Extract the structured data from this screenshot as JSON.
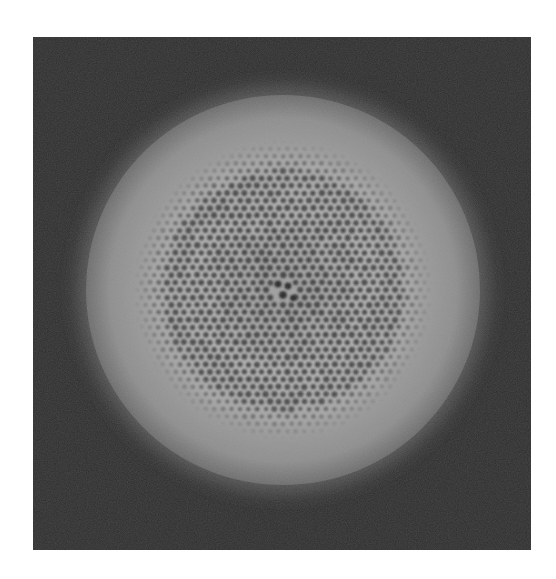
{
  "figure": {
    "frame": {
      "x": 33,
      "y": 37,
      "width": 498,
      "height": 513
    },
    "colors": {
      "page_background": "#ffffff",
      "frame_background": "#2b2b2b",
      "disk_rim": "#8e8e8e",
      "disk_glow": "#5a5a5a",
      "ridge": "#b4b4b4",
      "pore": "#3a3a3a",
      "center_pore": "#202020"
    },
    "disk": {
      "cx": 250,
      "cy": 253,
      "rx": 197,
      "ry": 195
    },
    "pore_field": {
      "radius": 150,
      "spacing": 8.6,
      "pore_radius": 2.9
    },
    "central_pores": [
      {
        "dx": -5,
        "dy": -6,
        "r": 3.6
      },
      {
        "dx": 5,
        "dy": -4,
        "r": 3.4
      },
      {
        "dx": 0,
        "dy": 5,
        "r": 3.8
      },
      {
        "dx": 10,
        "dy": 8,
        "r": 3.0
      }
    ]
  }
}
